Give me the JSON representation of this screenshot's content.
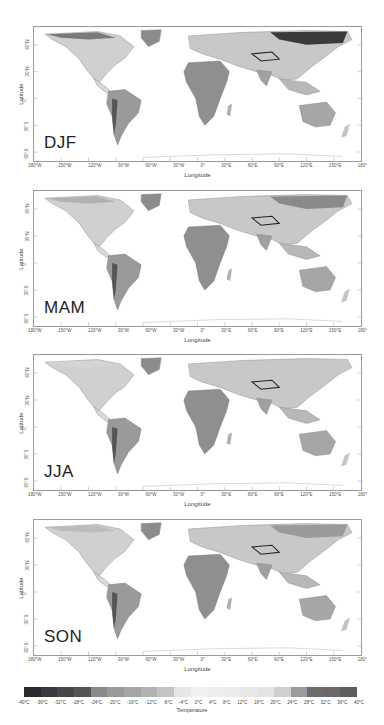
{
  "figure": {
    "panels": [
      {
        "season": "DJF",
        "top": 26,
        "height": 136
      },
      {
        "season": "MAM",
        "top": 190,
        "height": 137
      },
      {
        "season": "JJA",
        "top": 354,
        "height": 137
      },
      {
        "season": "SON",
        "top": 519,
        "height": 137
      }
    ],
    "y_axis": {
      "label": "Latitude",
      "ticks": [
        "60°N",
        "30°N",
        "0°",
        "30°S",
        "60°S"
      ]
    },
    "x_axis": {
      "label": "Longitude",
      "ticks": [
        "180°W",
        "150°W",
        "120°W",
        "90°W",
        "60°W",
        "30°W",
        "0°",
        "30°E",
        "60°E",
        "90°E",
        "120°E",
        "150°E",
        "180°"
      ]
    },
    "colorbar": {
      "title": "Temperature",
      "ticks": [
        "-40°C",
        "-36°C",
        "-32°C",
        "-28°C",
        "-24°C",
        "-20°C",
        "-16°C",
        "-12°C",
        "-8°C",
        "-4°C",
        "0°C",
        "4°C",
        "8°C",
        "12°C",
        "16°C",
        "20°C",
        "24°C",
        "28°C",
        "32°C",
        "36°C",
        "40°C"
      ],
      "colors": [
        "#2a2a2a",
        "#3a3a3a",
        "#474747",
        "#555555",
        "#8a8a8a",
        "#9a9a9a",
        "#a6a6a6",
        "#b2b2b2",
        "#c4c4c4",
        "#e6e6e6",
        "#f0f0f0",
        "#eeeeee",
        "#ebebeb",
        "#e8e8e8",
        "#e4e4e4",
        "#cfcfcf",
        "#9b9b9b",
        "#6c6c6c",
        "#6a6a6a",
        "#5e5e5e"
      ]
    }
  },
  "chart_data": {
    "type": "heatmap",
    "panels": [
      "DJF",
      "MAM",
      "JJA",
      "SON"
    ],
    "xlabel": "Longitude",
    "ylabel": "Latitude",
    "xlim": [
      -180,
      180
    ],
    "ylim": [
      -60,
      80
    ],
    "x_ticks": [
      "180°W",
      "150°W",
      "120°W",
      "90°W",
      "60°W",
      "30°W",
      "0°",
      "30°E",
      "60°E",
      "90°E",
      "120°E",
      "150°E",
      "180°"
    ],
    "y_ticks": [
      "60°N",
      "30°N",
      "0°",
      "30°S",
      "60°S"
    ],
    "colorbar": {
      "label": "Temperature",
      "min": -40,
      "max": 40,
      "step": 4,
      "unit": "°C"
    },
    "annotations": {
      "DJF": "Coldest values (~-36 to -40°C) over NE Siberia; warm (24-28°C) over Amazon, central Africa, N Australia",
      "MAM": "Warmest (28-32°C) over Sahel/West Africa and India; cold Arctic margins",
      "JJA": "Warmest (32-36°C) over Sahara/Arabia; Tibetan Plateau cold contour",
      "SON": "Warm (24-28°C) over Amazon, Africa, N Australia; cooling in high northern latitudes"
    }
  }
}
